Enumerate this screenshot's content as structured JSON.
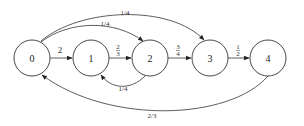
{
  "diagram": {
    "type": "state-transition-graph",
    "nodes": [
      {
        "id": "0",
        "label": "0",
        "cx": 32,
        "cy": 58
      },
      {
        "id": "1",
        "label": "1",
        "cx": 91,
        "cy": 58
      },
      {
        "id": "2",
        "label": "2",
        "cx": 150,
        "cy": 58
      },
      {
        "id": "3",
        "label": "3",
        "cx": 210,
        "cy": 58
      },
      {
        "id": "4",
        "label": "4",
        "cx": 268,
        "cy": 58
      }
    ],
    "edges": [
      {
        "from": "0",
        "to": "1",
        "label": "2"
      },
      {
        "from": "1",
        "to": "2",
        "label_num": "2",
        "label_den": "3"
      },
      {
        "from": "2",
        "to": "3",
        "label_num": "3",
        "label_den": "4"
      },
      {
        "from": "3",
        "to": "4",
        "label_num": "1",
        "label_den": "2"
      },
      {
        "from": "0",
        "to": "2",
        "label": "1/4"
      },
      {
        "from": "0",
        "to": "3",
        "label": "1/4"
      },
      {
        "from": "2",
        "to": "1",
        "label": "1/4"
      },
      {
        "from": "4",
        "to": "0",
        "label": "2/3"
      }
    ]
  }
}
